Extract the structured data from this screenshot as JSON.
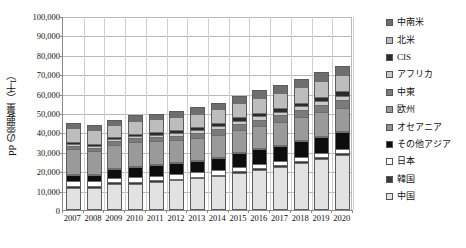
{
  "chart_data": {
    "type": "bar",
    "stacked": true,
    "title": "",
    "xlabel": "",
    "ylabel": "PP の需要量（千t）",
    "ylim": [
      0,
      100000
    ],
    "ytick_step": 10000,
    "ytick_labels": [
      "0",
      "10,000",
      "20,000",
      "30,000",
      "40,000",
      "50,000",
      "60,000",
      "70,000",
      "80,000",
      "90,000",
      "100,000"
    ],
    "ytick_values": [
      0,
      10000,
      20000,
      30000,
      40000,
      50000,
      60000,
      70000,
      80000,
      90000,
      100000
    ],
    "grid": true,
    "legend_position": "right",
    "categories": [
      "2007",
      "2008",
      "2009",
      "2010",
      "2011",
      "2012",
      "2013",
      "2014",
      "2015",
      "2016",
      "2017",
      "2018",
      "2019",
      "2020"
    ],
    "series": [
      {
        "name": "中国",
        "color": "#e2e2e2",
        "values": [
          10300,
          10300,
          12600,
          12600,
          13600,
          14300,
          15300,
          16300,
          18300,
          19800,
          21300,
          23300,
          25300,
          27300
        ]
      },
      {
        "name": "韓国",
        "color": "#3a3a3a",
        "values": [
          1000,
          1000,
          900,
          900,
          900,
          900,
          900,
          900,
          900,
          900,
          900,
          900,
          900,
          900
        ]
      },
      {
        "name": "日本",
        "color": "#ffffff",
        "values": [
          2500,
          2400,
          2200,
          2300,
          2200,
          2200,
          2200,
          2200,
          2100,
          2100,
          2100,
          2100,
          2100,
          2100
        ]
      },
      {
        "name": "その他アジア",
        "color": "#0d0d0d",
        "values": [
          3100,
          3100,
          4500,
          5500,
          5400,
          5600,
          5900,
          6300,
          6900,
          7400,
          7700,
          8100,
          8500,
          8800
        ]
      },
      {
        "name": "オセアニア",
        "color": "#8f8f8f",
        "values": [
          400,
          400,
          400,
          400,
          400,
          400,
          400,
          400,
          400,
          400,
          400,
          400,
          400,
          400
        ]
      },
      {
        "name": "欧州",
        "color": "#9a9a9a",
        "values": [
          12900,
          12200,
          11900,
          12200,
          11700,
          11400,
          11500,
          11600,
          11700,
          11800,
          11900,
          12000,
          12100,
          12200
        ]
      },
      {
        "name": "中東",
        "color": "#7b7b7b",
        "values": [
          1600,
          1600,
          1700,
          1900,
          2100,
          2300,
          2500,
          2700,
          2900,
          3100,
          3300,
          3500,
          3700,
          3900
        ]
      },
      {
        "name": "アフリカ",
        "color": "#cacaca",
        "values": [
          1100,
          1100,
          1200,
          1300,
          1400,
          1500,
          1600,
          1700,
          1800,
          1900,
          2000,
          2100,
          2200,
          2300
        ]
      },
      {
        "name": "CIS",
        "color": "#2b2b2b",
        "values": [
          900,
          900,
          1000,
          1100,
          1200,
          1300,
          1400,
          1500,
          1600,
          1700,
          1800,
          1900,
          2000,
          2100
        ]
      },
      {
        "name": "北米",
        "color": "#bdbdbd",
        "values": [
          7200,
          6900,
          6200,
          6600,
          6700,
          6800,
          6900,
          7100,
          7300,
          7500,
          7700,
          7900,
          8100,
          8300
        ]
      },
      {
        "name": "中南米",
        "color": "#6e6e6e",
        "values": [
          3000,
          3000,
          2800,
          2900,
          3000,
          3100,
          3300,
          3500,
          3700,
          3900,
          4100,
          4300,
          4500,
          4700
        ]
      }
    ],
    "totals": [
      44000,
      42900,
      45400,
      47700,
      48600,
      49800,
      51900,
      54200,
      57600,
      60500,
      63200,
      66500,
      69800,
      73000
    ]
  },
  "legend": {
    "items": [
      {
        "label": "中南米",
        "color": "#6e6e6e"
      },
      {
        "label": "北米",
        "color": "#bdbdbd"
      },
      {
        "label": "CIS",
        "color": "#2b2b2b"
      },
      {
        "label": "アフリカ",
        "color": "#cacaca"
      },
      {
        "label": "中東",
        "color": "#7b7b7b"
      },
      {
        "label": "欧州",
        "color": "#9a9a9a"
      },
      {
        "label": "オセアニア",
        "color": "#8f8f8f"
      },
      {
        "label": "その他アジア",
        "color": "#0d0d0d"
      },
      {
        "label": "日本",
        "color": "#ffffff"
      },
      {
        "label": "韓国",
        "color": "#3a3a3a"
      },
      {
        "label": "中国",
        "color": "#e2e2e2"
      }
    ]
  },
  "caption": ""
}
